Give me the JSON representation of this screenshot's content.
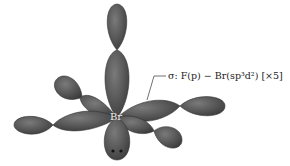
{
  "diagram": {
    "central_atom": "Br",
    "label": "σ: F(p) − Br(sp³d²) [×5]",
    "lone_pair": "••",
    "lobe_color": "#5a5a5a",
    "lobe_edge": "#3a3a3a"
  }
}
